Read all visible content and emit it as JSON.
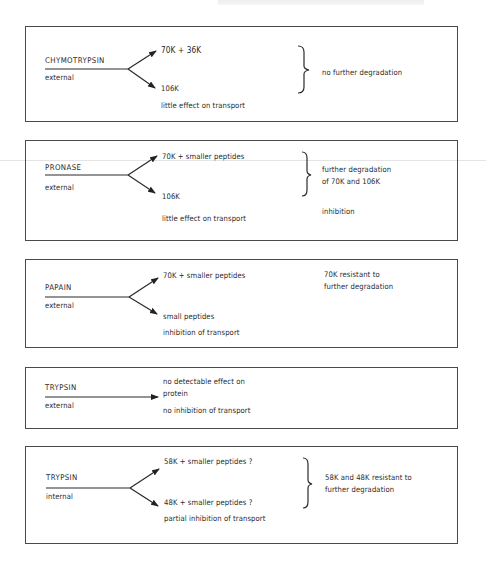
{
  "diagram": {
    "header_text": "",
    "panels": [
      {
        "enzyme": "CHYMOTRYPSIN",
        "location": "external",
        "products": [
          "70K + 36K",
          "106K"
        ],
        "transport_effect": "little effect on transport",
        "outcome": [
          "no further degradation"
        ]
      },
      {
        "enzyme": "PRONASE",
        "location": "external",
        "products": [
          "70K + smaller peptides",
          "106K"
        ],
        "transport_effect": "little effect on transport",
        "outcome": [
          "further degradation",
          "of 70K and 106K"
        ],
        "outcome_extra": "inhibition"
      },
      {
        "enzyme": "PAPAIN",
        "location": "external",
        "products": [
          "70K + smaller peptides",
          "small peptides"
        ],
        "transport_effect": "inhibition of transport",
        "outcome": [
          "70K resistant to",
          "further degradation"
        ]
      },
      {
        "enzyme": "TRYPSIN",
        "location": "external",
        "products": [
          "no detectable effect on",
          "protein"
        ],
        "transport_effect": "no inhibition of transport",
        "outcome": []
      },
      {
        "enzyme": "TRYPSIN",
        "location": "internal",
        "products": [
          "58K + smaller peptides ?",
          "48K + smaller peptides ?"
        ],
        "transport_effect": "partial inhibition of transport",
        "outcome": [
          "58K and 48K resistant to",
          "further degradation"
        ]
      }
    ]
  }
}
